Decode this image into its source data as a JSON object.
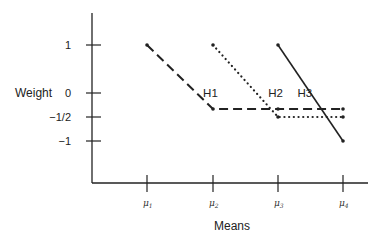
{
  "chart_data": {
    "type": "line",
    "title": "",
    "xlabel": "Means",
    "ylabel": "Weight",
    "x_categories": [
      "μ1",
      "μ2",
      "μ3",
      "μ4"
    ],
    "x_tick_labels": [
      {
        "base": "μ",
        "sub": "1"
      },
      {
        "base": "μ",
        "sub": "2"
      },
      {
        "base": "μ",
        "sub": "3"
      },
      {
        "base": "μ",
        "sub": "4"
      }
    ],
    "y_ticks": [
      1,
      0,
      -0.5,
      -1
    ],
    "y_tick_labels": [
      "1",
      "0",
      "−1/2",
      "−1"
    ],
    "ylim": [
      -2.8,
      2.3
    ],
    "grid": false,
    "legend": "none (inline labels)",
    "series": [
      {
        "name": "H1",
        "style": "dashed",
        "points": [
          [
            0,
            1
          ],
          [
            1,
            -0.333
          ],
          [
            2,
            -0.333
          ],
          [
            3,
            -0.333
          ]
        ],
        "label_at": [
          0.85,
          0.0
        ]
      },
      {
        "name": "H2",
        "style": "dotted",
        "points": [
          [
            1,
            1
          ],
          [
            2,
            -0.5
          ],
          [
            3,
            -0.5
          ]
        ],
        "label_at": [
          1.85,
          0.0
        ]
      },
      {
        "name": "H3",
        "style": "solid",
        "points": [
          [
            2,
            1
          ],
          [
            3,
            -1
          ]
        ],
        "label_at": [
          2.3,
          0.0
        ]
      }
    ],
    "colors": {
      "ink": "#222222",
      "background": "#ffffff"
    }
  }
}
